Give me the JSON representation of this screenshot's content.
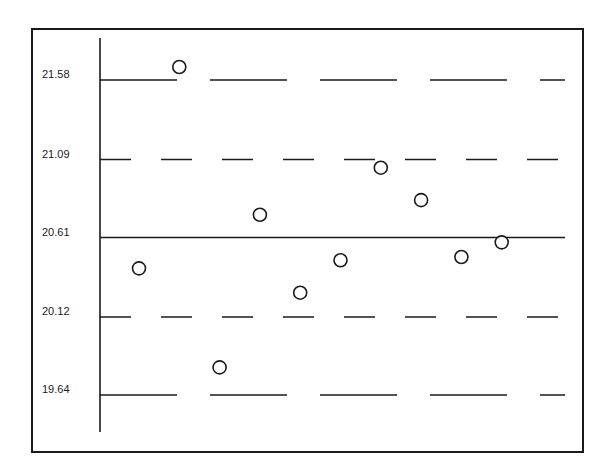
{
  "chart_data": {
    "type": "scatter",
    "title": "",
    "xlabel": "",
    "ylabel": "",
    "ylim": [
      19.45,
      21.81
    ],
    "grid": false,
    "legend": null,
    "y_ticks": [
      21.58,
      21.09,
      20.61,
      20.12,
      19.64
    ],
    "y_tick_labels": [
      "21.58",
      "21.09",
      "20.61",
      "20.12",
      "19.64"
    ],
    "reference_lines": [
      {
        "name": "upper-control-limit",
        "value": 21.58,
        "label": "21.58",
        "style": "long-dash"
      },
      {
        "name": "upper-warning-limit",
        "value": 21.09,
        "label": "21.09",
        "style": "short-dash"
      },
      {
        "name": "center-line",
        "value": 20.61,
        "label": "20.61",
        "style": "solid"
      },
      {
        "name": "lower-warning-limit",
        "value": 20.12,
        "label": "20.12",
        "style": "short-dash"
      },
      {
        "name": "lower-control-limit",
        "value": 19.64,
        "label": "19.64",
        "style": "long-dash"
      }
    ],
    "x": [
      1,
      2,
      3,
      4,
      5,
      6,
      7,
      8,
      9,
      10
    ],
    "values": [
      20.42,
      21.66,
      19.81,
      20.75,
      20.27,
      20.47,
      21.04,
      20.84,
      20.49,
      20.58
    ],
    "marker": "open-circle"
  },
  "colors": {
    "ink": "#1a1a1a",
    "background": "#ffffff"
  }
}
